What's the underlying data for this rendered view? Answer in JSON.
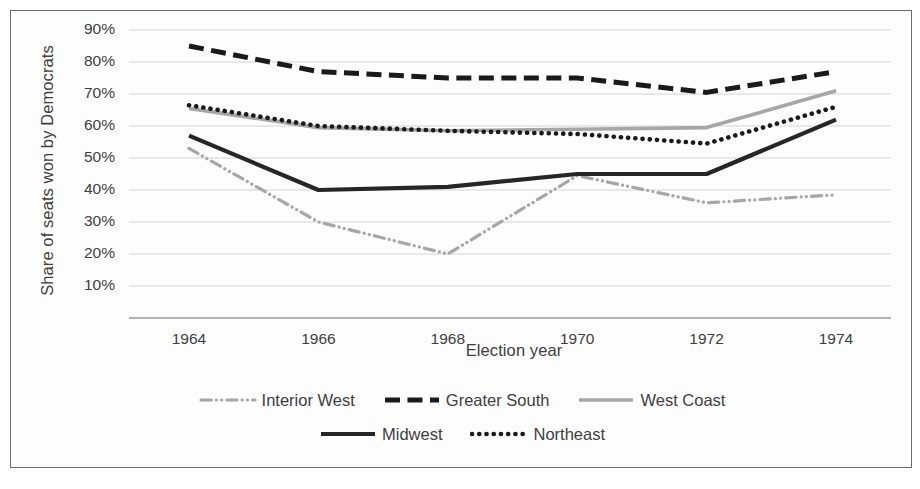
{
  "chart_data": {
    "type": "line",
    "title": "",
    "xlabel": "Election year",
    "ylabel": "Share of seats won by Democrats",
    "categories": [
      "1964",
      "1966",
      "1968",
      "1970",
      "1972",
      "1974"
    ],
    "x": [
      1964,
      1966,
      1968,
      1970,
      1972,
      1974
    ],
    "ylim": [
      0,
      90
    ],
    "ytick_labels": [
      "90%",
      "80%",
      "70%",
      "60%",
      "50%",
      "40%",
      "30%",
      "20%",
      "10%"
    ],
    "ytick_values": [
      90,
      80,
      70,
      60,
      50,
      40,
      30,
      20,
      10
    ],
    "grid": "horizontal",
    "legend_position": "bottom",
    "series": [
      {
        "name": "Interior West",
        "values": [
          53,
          30,
          20,
          44.5,
          36,
          38.5
        ],
        "color": "#a6a6a6",
        "style": "dash-dot",
        "width": 3.2
      },
      {
        "name": "Greater South",
        "values": [
          85,
          77,
          75,
          75,
          70.5,
          77
        ],
        "color": "#1a1a1a",
        "style": "dashed",
        "width": 5
      },
      {
        "name": "West Coast",
        "values": [
          65.5,
          59.5,
          58.5,
          59,
          59.5,
          71
        ],
        "color": "#a6a6a6",
        "style": "solid",
        "width": 3.6
      },
      {
        "name": "Midwest",
        "values": [
          57,
          40,
          41,
          45,
          45,
          62
        ],
        "color": "#262626",
        "style": "solid",
        "width": 4.2
      },
      {
        "name": "Northeast",
        "values": [
          66.5,
          60,
          58.5,
          57.5,
          54.5,
          66
        ],
        "color": "#1a1a1a",
        "style": "dotted",
        "width": 4.6
      }
    ]
  },
  "legend": {
    "rows": [
      [
        "Interior West",
        "Greater South",
        "West Coast"
      ],
      [
        "Midwest",
        "Northeast"
      ]
    ]
  },
  "colors": {
    "grid": "#d3d3d3",
    "axis": "#9a9a9a",
    "frame": "#6e6e6e",
    "text": "#404040",
    "background": "#ffffff"
  }
}
